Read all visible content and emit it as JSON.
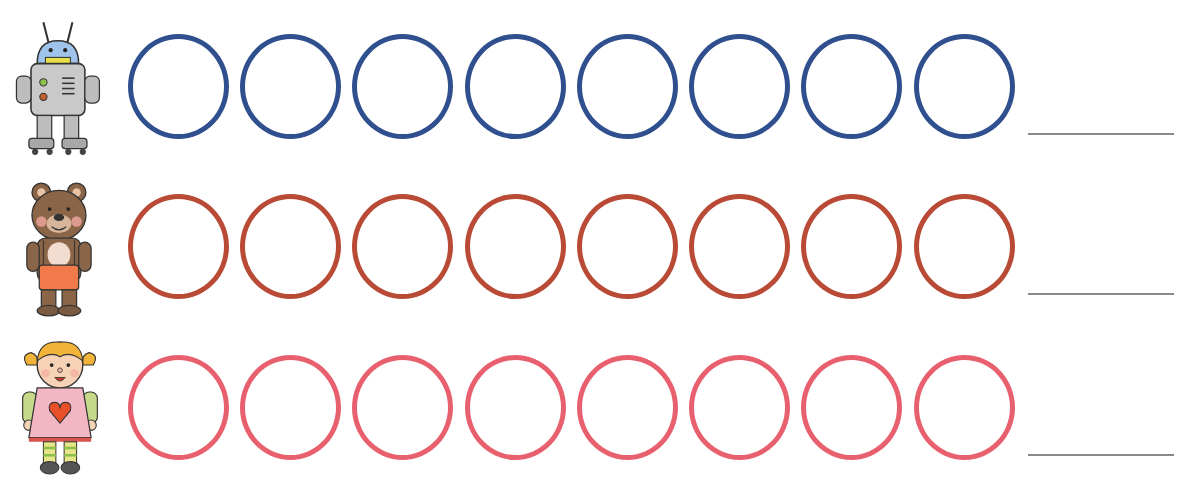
{
  "worksheet": {
    "rows": [
      {
        "toy": "robot",
        "icon": "robot-icon",
        "color": "#2f4f8e",
        "circle_count": 8,
        "answer": ""
      },
      {
        "toy": "teddy-bear",
        "icon": "teddy-bear-icon",
        "color": "#b84a36",
        "circle_count": 8,
        "answer": ""
      },
      {
        "toy": "doll",
        "icon": "doll-icon",
        "color": "#e8606e",
        "circle_count": 8,
        "answer": ""
      }
    ],
    "circle_left_positions": [
      128,
      240,
      352,
      465,
      577,
      689,
      801,
      914
    ]
  }
}
